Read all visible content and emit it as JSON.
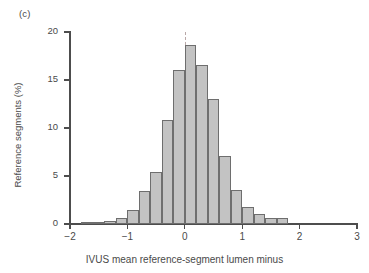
{
  "panel": {
    "label": "(c)"
  },
  "axes": {
    "ylabel": "Reference segments (%)",
    "xlabel": "IVUS mean reference-segment lumen minus",
    "yticks": [
      "0",
      "5",
      "10",
      "15",
      "20"
    ],
    "xticks": [
      "-2",
      "-1",
      "0",
      "1",
      "2",
      "3"
    ]
  },
  "colors": {
    "bar_fill": "#c3c3c3",
    "bar_edge": "#6e6e6e",
    "axis": "#4d4d4d",
    "text": "#4a4a4a",
    "zero_line": "#b9a8a8"
  },
  "chart_data": {
    "type": "bar",
    "title": "",
    "subtitle": "",
    "xlabel": "IVUS mean reference-segment lumen minus",
    "ylabel": "Reference segments (%)",
    "xlim": [
      -2,
      3
    ],
    "ylim": [
      0,
      20
    ],
    "xticks": [
      -2,
      -1,
      0,
      1,
      2,
      3
    ],
    "yticks": [
      0,
      5,
      10,
      15,
      20
    ],
    "grid": false,
    "legend": "none",
    "bin_width": 0.2,
    "annotations": [
      {
        "type": "vline",
        "x": 0,
        "style": "dashed",
        "color": "#b9a8a8"
      },
      {
        "type": "panel-label",
        "text": "(c)"
      }
    ],
    "bin_starts": [
      -1.8,
      -1.6,
      -1.4,
      -1.2,
      -1.0,
      -0.8,
      -0.6,
      -0.4,
      -0.2,
      0.0,
      0.2,
      0.4,
      0.6,
      0.8,
      1.0,
      1.2,
      1.4,
      1.6,
      1.8,
      2.0,
      2.2
    ],
    "categories": [
      "-1.8",
      "-1.6",
      "-1.4",
      "-1.2",
      "-1.0",
      "-0.8",
      "-0.6",
      "-0.4",
      "-0.2",
      "0.0",
      "0.2",
      "0.4",
      "0.6",
      "0.8",
      "1.0",
      "1.2",
      "1.4",
      "1.6",
      "1.8",
      "2.0",
      "2.2"
    ],
    "values": [
      0.15,
      0.2,
      0.35,
      0.65,
      1.5,
      3.4,
      5.4,
      10.8,
      16.0,
      18.6,
      16.6,
      13.0,
      7.1,
      3.5,
      1.8,
      1.0,
      0.65,
      0.65,
      0.0,
      0.0,
      0.0
    ]
  }
}
